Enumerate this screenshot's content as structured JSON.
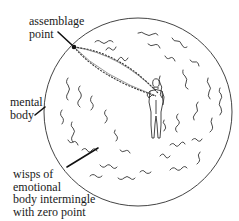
{
  "diagram": {
    "labels": {
      "assemblage_point": [
        "assemblage",
        "point"
      ],
      "mental_body": [
        "mental",
        "body"
      ],
      "wisps": [
        "wisps of",
        "emotional",
        "body intermingle",
        "with zero point"
      ]
    },
    "elements": {
      "sphere": "mental-body-sphere",
      "figure": "human-figure",
      "connection": "chain-cords-from-assemblage-point-to-chest",
      "wisps": "emotional-body-wisps"
    },
    "colors": {
      "stroke": "#333333",
      "text": "#1a1a1a",
      "background": "#ffffff"
    }
  }
}
